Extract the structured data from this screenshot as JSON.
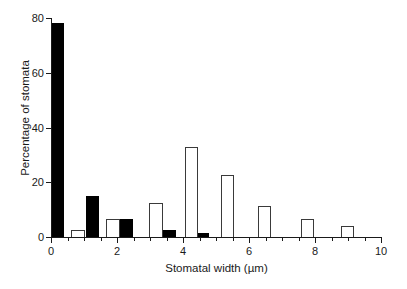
{
  "chart_data": {
    "type": "bar",
    "title": "",
    "subtitle": "",
    "xlabel": "Stomatal width (µm)",
    "ylabel": "Percentage of stomata",
    "xlim": [
      0,
      10
    ],
    "ylim": [
      0,
      80
    ],
    "grid": false,
    "legend": "none",
    "x_ticks": [
      0,
      2,
      4,
      6,
      8,
      10
    ],
    "x_tick_labels": [
      "0",
      "2",
      "4",
      "6",
      "8",
      "10"
    ],
    "x_minor_ticks": [
      0.5,
      1,
      1.5,
      2.5,
      3,
      3.5,
      4.5,
      5,
      5.5,
      6.5,
      7,
      7.5,
      8.5,
      9,
      9.5
    ],
    "y_ticks": [
      0,
      20,
      40,
      60,
      80
    ],
    "y_tick_labels": [
      "0",
      "20",
      "40",
      "60",
      "80"
    ],
    "bar_width": 0.4,
    "series": [
      {
        "name": "closed",
        "fill": "#000000",
        "edge": "#000000",
        "points": [
          {
            "x": 0.0,
            "value": 78.0
          },
          {
            "x": 1.05,
            "value": 15.0
          },
          {
            "x": 2.1,
            "value": 6.5
          },
          {
            "x": 3.4,
            "value": 2.5
          },
          {
            "x": 4.4,
            "value": 1.5
          }
        ]
      },
      {
        "name": "open",
        "fill": "#ffffff",
        "edge": "#3a3a3a",
        "points": [
          {
            "x": 0.62,
            "value": 2.5
          },
          {
            "x": 1.68,
            "value": 6.5
          },
          {
            "x": 2.98,
            "value": 12.5
          },
          {
            "x": 4.05,
            "value": 33.0
          },
          {
            "x": 5.15,
            "value": 22.5
          },
          {
            "x": 6.28,
            "value": 11.5
          },
          {
            "x": 7.58,
            "value": 6.5
          },
          {
            "x": 8.78,
            "value": 4.0
          }
        ]
      }
    ]
  }
}
